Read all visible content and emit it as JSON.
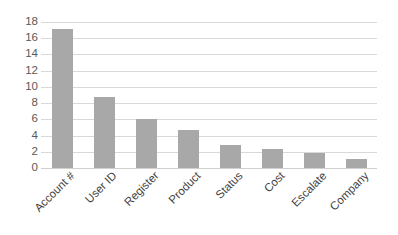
{
  "chart_data": {
    "type": "bar",
    "title": "",
    "subtitle": "",
    "xlabel": "",
    "ylabel": "",
    "categories": [
      "Account #",
      "User ID",
      "Register",
      "Product",
      "Status",
      "Cost",
      "Escalate",
      "Company"
    ],
    "values": [
      17.2,
      8.8,
      6.0,
      4.7,
      2.8,
      2.3,
      1.9,
      1.1
    ],
    "ylim": [
      0,
      18
    ],
    "ytick_step": 2,
    "ytick_labels": [
      "0",
      "2",
      "4",
      "6",
      "8",
      "10",
      "12",
      "14",
      "16",
      "18"
    ],
    "grid": "horizontal",
    "legend": "none",
    "bar_color": "#a8a8a8",
    "gridline_color": "#d9d9d9",
    "background_color": "#ffffff",
    "label_rotation_degrees": -45
  }
}
